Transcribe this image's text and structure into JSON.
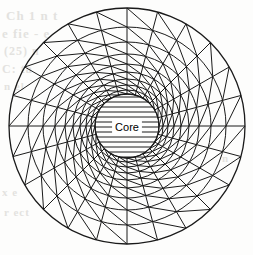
{
  "figure": {
    "name": "radial-finite-element-mesh",
    "background_color": "#fdfdfc",
    "line_color": "#1a1a1a",
    "hatch_color": "#1a1a1a"
  },
  "core": {
    "label": "Core",
    "label_color": "#000000",
    "label_background": "#ffffff",
    "center_x": 127,
    "center_y": 126,
    "radius": 32,
    "hatch_spacing": 5,
    "hatch_orientation": "horizontal"
  },
  "mesh": {
    "center_x": 127,
    "center_y": 126,
    "outer_radius": 118,
    "inner_radius": 32,
    "spokes": 24,
    "spoke_start_angle_deg": 0,
    "ring_radii": [
      32,
      36,
      41,
      47,
      54,
      62,
      72,
      84,
      99,
      118
    ],
    "diagonal_direction": "ccw",
    "stroke_width_outer": 1.3,
    "stroke_width_mesh": 1.0
  },
  "artifacts": {
    "description": "faint scanned bleed-through ghost text",
    "items": [
      {
        "text": "Ch 1 n t",
        "x": 6,
        "y": 8,
        "size": 13
      },
      {
        "text": "e fie - e",
        "x": 2,
        "y": 26,
        "size": 13
      },
      {
        "text": "(25) n",
        "x": 4,
        "y": 44,
        "size": 12
      },
      {
        "text": "C: ta",
        "x": 2,
        "y": 62,
        "size": 12
      },
      {
        "text": "n el",
        "x": 4,
        "y": 80,
        "size": 11
      },
      {
        "text": "x e",
        "x": 2,
        "y": 186,
        "size": 11
      },
      {
        "text": "r ect",
        "x": 4,
        "y": 206,
        "size": 11
      },
      {
        "text": "n",
        "x": 222,
        "y": 152,
        "size": 11
      }
    ]
  },
  "chart_data": {
    "type": "diagram",
    "elements": [
      {
        "name": "core-region",
        "shape": "circle",
        "radius": 32,
        "fill": "horizontal-hatch",
        "label": "Core"
      },
      {
        "name": "mesh-annulus",
        "shape": "annulus",
        "inner_radius": 32,
        "outer_radius": 118,
        "rings": 9,
        "sectors": 24,
        "element_type": "triangle"
      }
    ]
  }
}
